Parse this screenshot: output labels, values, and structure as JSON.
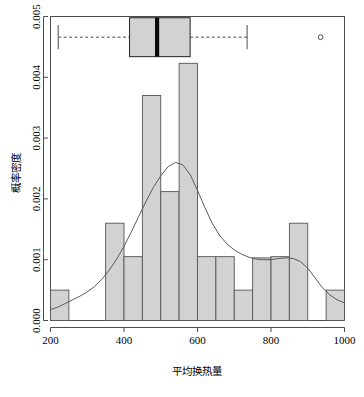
{
  "chart_data": {
    "type": "bar",
    "title": "",
    "xlabel": "平均换热量",
    "ylabel": "概率密度",
    "xlim": [
      200,
      1000
    ],
    "ylim": [
      0.0,
      0.005
    ],
    "grid": false,
    "legend": null,
    "x_ticks": [
      200,
      400,
      600,
      800,
      1000
    ],
    "x_tick_labels": [
      "200",
      "400",
      "600",
      "800",
      "1000"
    ],
    "y_ticks": [
      0.0,
      0.001,
      0.002,
      0.003,
      0.004,
      0.005
    ],
    "y_tick_labels": [
      "0.000",
      "0.001",
      "0.002",
      "0.003",
      "0.004",
      "0.005"
    ],
    "bin_width": 50,
    "bin_edges": [
      200,
      250,
      300,
      350,
      400,
      450,
      500,
      550,
      600,
      650,
      700,
      750,
      800,
      850,
      900,
      950,
      1000
    ],
    "categories": [
      "200-250",
      "250-300",
      "300-350",
      "350-400",
      "400-450",
      "450-500",
      "500-550",
      "550-600",
      "600-650",
      "650-700",
      "700-750",
      "750-800",
      "800-850",
      "850-900",
      "900-950",
      "950-1000"
    ],
    "values": [
      0.0005,
      0.0,
      0.0,
      0.0016,
      0.00105,
      0.0037,
      0.00212,
      0.00423,
      0.00105,
      0.00105,
      0.0005,
      0.00103,
      0.00105,
      0.0016,
      0.0,
      0.0005
    ],
    "density_curve": {
      "name": "kernel density estimate",
      "x": [
        200,
        220,
        240,
        260,
        280,
        300,
        320,
        340,
        360,
        380,
        400,
        420,
        440,
        460,
        480,
        500,
        520,
        540,
        560,
        580,
        600,
        620,
        640,
        660,
        680,
        700,
        720,
        740,
        760,
        780,
        800,
        820,
        840,
        860,
        880,
        900,
        920,
        940,
        960,
        980,
        1000
      ],
      "y": [
        0.00018,
        0.00022,
        0.00028,
        0.00034,
        0.0004,
        0.00047,
        0.00056,
        0.00068,
        0.00083,
        0.00101,
        0.00122,
        0.00146,
        0.00171,
        0.00196,
        0.00219,
        0.00238,
        0.00253,
        0.0026,
        0.00256,
        0.0024,
        0.00214,
        0.00186,
        0.0016,
        0.0014,
        0.00126,
        0.00116,
        0.00109,
        0.00104,
        0.00101,
        0.001,
        0.001,
        0.00102,
        0.00103,
        0.00102,
        0.00097,
        0.00086,
        0.0007,
        0.00054,
        0.00042,
        0.00034,
        0.00029
      ]
    },
    "boxplot": {
      "name": "平均换热量 boxplot",
      "lower_whisker": 221,
      "q1": 415,
      "median": 490,
      "q3": 580,
      "upper_whisker": 735,
      "outliers": [
        935
      ],
      "y_position_value": 0.00466,
      "box_half_height_value": 0.00032
    },
    "colors": {
      "bar_fill": "#d2d2d2",
      "bar_border": "#555555",
      "curve": "#5a5a5a",
      "box_fill": "#d2d2d2",
      "box_border": "#333333",
      "median": "#0a0a0a",
      "axis": "#4d4d4d",
      "background": "#ffffff"
    }
  },
  "caption": {
    "text": ""
  }
}
